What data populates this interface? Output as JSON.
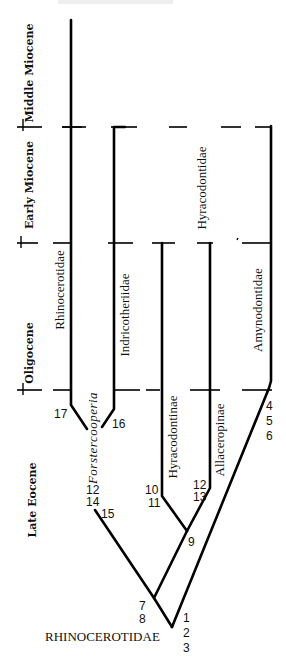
{
  "diagram": {
    "root_label": "RHINOCEROTIDAE",
    "epochs": [
      {
        "id": "middle-miocene",
        "label": "Middle Miocene"
      },
      {
        "id": "early-miocene",
        "label": "Early Miocene"
      },
      {
        "id": "oligocene",
        "label": "Oligocene"
      },
      {
        "id": "late-eocene",
        "label": "Late Eocene"
      }
    ],
    "taxa": [
      {
        "id": "rhinocerotidae",
        "label": "Rhinocerotidae",
        "italic": false
      },
      {
        "id": "indricotheriidae",
        "label": "Indricotheriidae",
        "italic": false
      },
      {
        "id": "hyracodontidae",
        "label": "Hyracodontidae",
        "italic": false
      },
      {
        "id": "amynodontidae",
        "label": "Amynodontidae",
        "italic": false
      },
      {
        "id": "forstercooperia",
        "label": "Forstercooperia",
        "italic": true
      },
      {
        "id": "hyracodontinae",
        "label": "Hyracodontinae",
        "italic": false
      },
      {
        "id": "allaceropinae",
        "label": "Allaceropinae",
        "italic": false
      }
    ],
    "character_labels": {
      "root": [
        "1",
        "2",
        "3"
      ],
      "amynodontidae": [
        "4",
        "5",
        "6"
      ],
      "node_7_8": [
        "7",
        "8"
      ],
      "node_9": [
        "9"
      ],
      "hyracodontinae": [
        "10",
        "11"
      ],
      "allaceropinae": [
        "12",
        "13"
      ],
      "forstercooperia_stem": [
        "12",
        "14",
        "15"
      ],
      "indricotheriidae": [
        "16"
      ],
      "rhinocerotidae": [
        "17"
      ]
    }
  }
}
